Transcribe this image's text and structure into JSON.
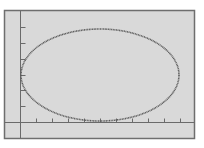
{
  "screen": {
    "type": "graphing-calculator-display",
    "colors": {
      "page_background": "#ffffff",
      "screen_background": "#d9d9d9",
      "frame": "#6e6e6e",
      "axes": "#6a6a6a",
      "curve": "#5a5a5a"
    }
  },
  "chart_data": {
    "type": "line",
    "title": "",
    "xlabel": "",
    "ylabel": "",
    "curve": "ellipse",
    "tick_marks": {
      "x_ticks_px": [
        36,
        52,
        68,
        84,
        100,
        116,
        132,
        148,
        164,
        180
      ],
      "y_ticks_px": [
        27,
        43,
        59,
        75,
        90,
        106
      ]
    },
    "ellipse_px": {
      "cx": 100,
      "cy": 75,
      "rx": 79,
      "ry": 46
    },
    "ellipse_in_tick_units": {
      "center_x": 5,
      "center_y": 3,
      "semi_axis_x": 5,
      "semi_axis_y": 3
    },
    "grid": false,
    "legend": null
  }
}
